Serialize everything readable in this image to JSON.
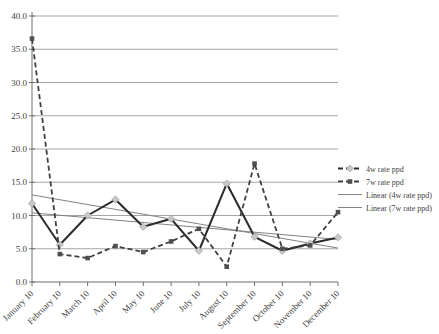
{
  "figure": {
    "width": 439,
    "height": 334,
    "background": "#ffffff"
  },
  "chart_data": {
    "type": "line",
    "title": "",
    "xlabel": "",
    "ylabel": "",
    "categories": [
      "January 10",
      "February 10",
      "March 10",
      "April 10",
      "May 10",
      "June 10",
      "July 10",
      "August 10",
      "September 10",
      "October 10",
      "November 10",
      "December 10"
    ],
    "series": [
      {
        "name": "4w rate ppd",
        "kind": "data",
        "line_style": "solid",
        "line_color": "#2b2b2b",
        "line_width": 2,
        "marker": "diamond",
        "marker_color": "#c8c8c8",
        "values": [
          11.8,
          5.6,
          10.0,
          12.4,
          8.3,
          9.5,
          4.7,
          14.8,
          6.8,
          4.7,
          5.8,
          6.7
        ]
      },
      {
        "name": "7w rate ppd",
        "kind": "data",
        "line_style": "dashed",
        "line_color": "#404040",
        "line_width": 1.8,
        "marker": "square",
        "marker_color": "#4f4f4f",
        "values": [
          36.6,
          4.2,
          3.6,
          5.4,
          4.5,
          6.1,
          8.0,
          2.3,
          17.8,
          5.0,
          5.5,
          10.5
        ]
      },
      {
        "name": "Linear (4w rate ppd)",
        "kind": "trendline",
        "line_style": "solid",
        "line_color": "#828282",
        "line_width": 1,
        "marker": "none",
        "endpoints": [
          10.4,
          6.4
        ]
      },
      {
        "name": "Linear (7w rate ppd)",
        "kind": "trendline",
        "line_style": "solid",
        "line_color": "#828282",
        "line_width": 1,
        "marker": "none",
        "endpoints": [
          13.1,
          5.1
        ]
      }
    ],
    "ylim": [
      0,
      40
    ],
    "ytick_step": 5,
    "ytick_labels": [
      "0.0",
      "5.0",
      "10.0",
      "15.0",
      "20.0",
      "25.0",
      "30.0",
      "35.0",
      "40.0"
    ],
    "grid": "horizontal",
    "legend_position": "right",
    "x_label_rotation_deg": -45
  },
  "legend": {
    "items": [
      {
        "label": "4w rate ppd"
      },
      {
        "label": "7w rate ppd"
      },
      {
        "label": "Linear (4w rate ppd)"
      },
      {
        "label": "Linear (7w rate ppd)"
      }
    ]
  },
  "colors": {
    "background": "#ffffff",
    "gridline": "#a6a6a6",
    "axis": "#6e6e6e",
    "tick_text": "#3f3f3f",
    "legend_text": "#3f3f3f"
  }
}
